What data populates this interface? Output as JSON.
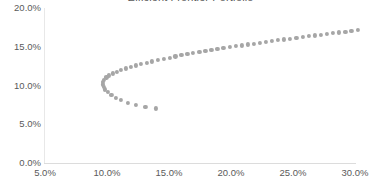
{
  "chart_data": {
    "type": "scatter",
    "title": "Efficient Frontier Portfolio",
    "xlabel": "",
    "ylabel": "",
    "xlim": [
      5.0,
      30.0
    ],
    "ylim": [
      0.0,
      20.0
    ],
    "x_ticks": [
      "5.0%",
      "10.0%",
      "15.0%",
      "20.0%",
      "25.0%",
      "30.0%"
    ],
    "y_ticks": [
      "0.0%",
      "5.0%",
      "10.0%",
      "15.0%",
      "20.0%"
    ],
    "x_tick_values": [
      5.0,
      10.0,
      15.0,
      20.0,
      25.0,
      30.0
    ],
    "y_tick_values": [
      0.0,
      5.0,
      10.0,
      15.0,
      20.0
    ],
    "grid": false,
    "legend": null,
    "marker_color": "#a6a6a6",
    "marker_size": 4.2,
    "series": [
      {
        "name": "Portfolio frontier",
        "points": [
          [
            13.95,
            7.05
          ],
          [
            13.1,
            7.25
          ],
          [
            12.35,
            7.5
          ],
          [
            11.7,
            7.8
          ],
          [
            11.15,
            8.1
          ],
          [
            10.7,
            8.45
          ],
          [
            10.35,
            8.8
          ],
          [
            10.05,
            9.15
          ],
          [
            9.85,
            9.5
          ],
          [
            9.72,
            9.85
          ],
          [
            9.66,
            10.15
          ],
          [
            9.68,
            10.45
          ],
          [
            9.78,
            10.75
          ],
          [
            9.95,
            11.05
          ],
          [
            10.18,
            11.3
          ],
          [
            10.45,
            11.55
          ],
          [
            10.78,
            11.8
          ],
          [
            11.12,
            12.0
          ],
          [
            11.5,
            12.2
          ],
          [
            11.9,
            12.4
          ],
          [
            12.32,
            12.6
          ],
          [
            12.75,
            12.78
          ],
          [
            13.2,
            12.95
          ],
          [
            13.65,
            13.12
          ],
          [
            14.12,
            13.3
          ],
          [
            14.58,
            13.45
          ],
          [
            15.05,
            13.6
          ],
          [
            15.52,
            13.75
          ],
          [
            16.0,
            13.9
          ],
          [
            16.48,
            14.05
          ],
          [
            16.96,
            14.2
          ],
          [
            17.45,
            14.32
          ],
          [
            17.93,
            14.45
          ],
          [
            18.42,
            14.58
          ],
          [
            18.9,
            14.7
          ],
          [
            19.39,
            14.82
          ],
          [
            19.88,
            14.95
          ],
          [
            20.37,
            15.07
          ],
          [
            20.86,
            15.18
          ],
          [
            21.35,
            15.3
          ],
          [
            21.84,
            15.41
          ],
          [
            22.33,
            15.52
          ],
          [
            22.82,
            15.63
          ],
          [
            23.31,
            15.74
          ],
          [
            23.8,
            15.85
          ],
          [
            24.29,
            15.95
          ],
          [
            24.78,
            16.06
          ],
          [
            25.28,
            16.16
          ],
          [
            25.77,
            16.26
          ],
          [
            26.26,
            16.36
          ],
          [
            26.75,
            16.46
          ],
          [
            27.25,
            16.56
          ],
          [
            27.74,
            16.66
          ],
          [
            28.23,
            16.75
          ],
          [
            28.73,
            16.85
          ],
          [
            29.22,
            16.94
          ],
          [
            29.71,
            17.03
          ],
          [
            30.21,
            17.13
          ],
          [
            30.7,
            17.22
          ],
          [
            31.19,
            17.31
          ],
          [
            31.69,
            17.4
          ],
          [
            32.18,
            17.49
          ]
        ]
      }
    ]
  },
  "axes": {
    "x_axis_name": "x-axis",
    "y_axis_name": "y-axis"
  }
}
